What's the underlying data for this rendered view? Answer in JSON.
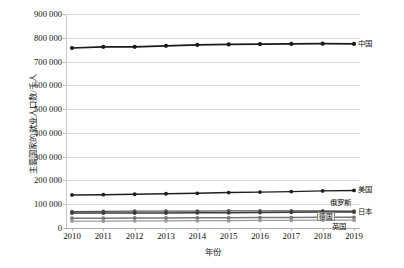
{
  "chart_data": {
    "type": "line",
    "title": "",
    "xlabel": "年份",
    "ylabel": "主要国家的就业人口数/千人",
    "x": [
      2010,
      2011,
      2012,
      2013,
      2014,
      2015,
      2016,
      2017,
      2018,
      2019
    ],
    "xtick_labels": [
      "2010",
      "2011",
      "2012",
      "2013",
      "2014",
      "2015",
      "2016",
      "2017",
      "2018",
      "2019"
    ],
    "ylim": [
      0,
      900000
    ],
    "ytick_labels": [
      "0",
      "100 000",
      "200 000",
      "300 000",
      "400 000",
      "500 000",
      "600 000",
      "700 000",
      "800 000",
      "900 000"
    ],
    "ytick_values": [
      0,
      100000,
      200000,
      300000,
      400000,
      500000,
      600000,
      700000,
      800000,
      900000
    ],
    "grid": "horizontal",
    "legend_position": "line-end-labels",
    "series": [
      {
        "name": "中国",
        "color": "#1a1a1a",
        "values": [
          757000,
          762000,
          762000,
          766000,
          770000,
          772000,
          773000,
          774000,
          775000,
          774000
        ]
      },
      {
        "name": "美国",
        "color": "#1f1f1f",
        "values": [
          139000,
          140000,
          142000,
          144000,
          146000,
          149000,
          151000,
          153000,
          156000,
          158000
        ]
      },
      {
        "name": "俄罗斯",
        "color": "#555555",
        "values": [
          69000,
          70000,
          71000,
          71000,
          71000,
          72000,
          72000,
          72000,
          72000,
          71000
        ]
      },
      {
        "name": "日本",
        "color": "#3a3a3a",
        "values": [
          63000,
          63000,
          63000,
          63000,
          64000,
          64000,
          65000,
          66000,
          67000,
          67000
        ]
      },
      {
        "name": "德国",
        "color": "#777777",
        "values": [
          41000,
          41000,
          42000,
          42000,
          43000,
          43000,
          44000,
          44000,
          45000,
          45000
        ]
      },
      {
        "name": "英国",
        "color": "#9a9a9a",
        "values": [
          29000,
          29000,
          30000,
          30000,
          31000,
          31000,
          32000,
          32000,
          33000,
          33000
        ]
      }
    ]
  }
}
